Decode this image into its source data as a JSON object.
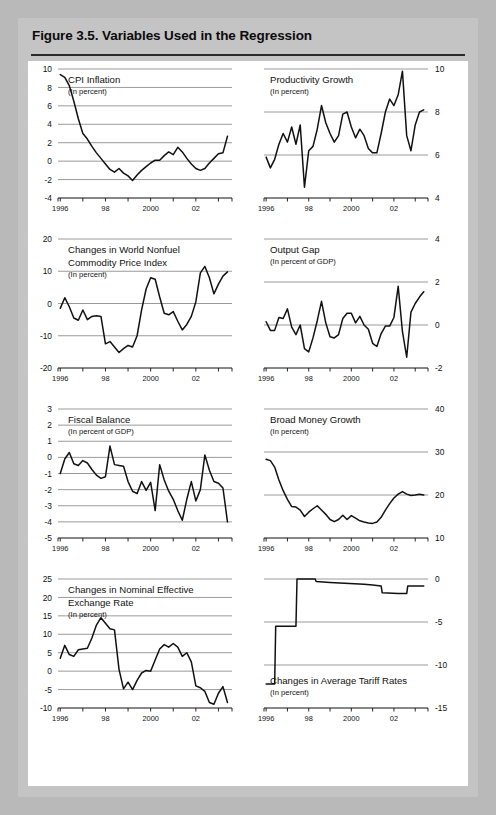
{
  "figure": {
    "title": "Figure 3.5. Variables Used in the Regression",
    "sources": "Sources:  CEIC database; and IMF staff calculations."
  },
  "chart_data": [
    {
      "id": "cpi-inflation",
      "type": "line",
      "title": "CPI Inflation",
      "subtitle": "(In percent)",
      "xlabel": "",
      "ylabel": "",
      "ylim": [
        -4,
        10
      ],
      "yticks": [
        -4,
        -2,
        0,
        2,
        4,
        6,
        8,
        10
      ],
      "ytick_labels": [
        "-4",
        "-2",
        "0",
        "2",
        "4",
        "6",
        "8",
        "10"
      ],
      "axis_side": "left",
      "grid": true,
      "xlim": [
        1995.9,
        2003.6
      ],
      "xticks": [
        1996,
        1997,
        1998,
        1999,
        2000,
        2001,
        2002,
        2003
      ],
      "xtick_labels": [
        "1996",
        "",
        "98",
        "",
        "2000",
        "",
        "02",
        ""
      ],
      "x": [
        1996.0,
        1996.2,
        1996.4,
        1996.6,
        1996.8,
        1997.0,
        1997.2,
        1997.4,
        1997.6,
        1997.8,
        1998.0,
        1998.2,
        1998.4,
        1998.6,
        1998.8,
        1999.0,
        1999.2,
        1999.4,
        1999.6,
        1999.8,
        2000.0,
        2000.2,
        2000.4,
        2000.6,
        2000.8,
        2001.0,
        2001.2,
        2001.4,
        2001.6,
        2001.8,
        2002.0,
        2002.2,
        2002.4,
        2002.6,
        2002.8,
        2003.0,
        2003.2,
        2003.4
      ],
      "values": [
        9.4,
        9.1,
        8.2,
        6.5,
        4.6,
        3.0,
        2.4,
        1.6,
        0.9,
        0.3,
        -0.3,
        -0.9,
        -1.2,
        -0.8,
        -1.3,
        -1.6,
        -2.1,
        -1.5,
        -1.0,
        -0.6,
        -0.2,
        0.1,
        0.1,
        0.6,
        1.0,
        0.7,
        1.5,
        1.0,
        0.3,
        -0.3,
        -0.8,
        -1.0,
        -0.8,
        -0.2,
        0.3,
        0.8,
        0.9,
        2.7
      ]
    },
    {
      "id": "productivity-growth",
      "type": "line",
      "title": "Productivity Growth",
      "subtitle": "(In percent)",
      "xlabel": "",
      "ylabel": "",
      "ylim": [
        4,
        10
      ],
      "yticks": [
        4,
        6,
        8,
        10
      ],
      "ytick_labels": [
        "4",
        "6",
        "8",
        "10"
      ],
      "axis_side": "right",
      "grid": true,
      "xlim": [
        1995.9,
        2003.6
      ],
      "xticks": [
        1996,
        1997,
        1998,
        1999,
        2000,
        2001,
        2002,
        2003
      ],
      "xtick_labels": [
        "1996",
        "",
        "98",
        "",
        "2000",
        "",
        "02",
        ""
      ],
      "x": [
        1996.0,
        1996.2,
        1996.4,
        1996.6,
        1996.8,
        1997.0,
        1997.2,
        1997.4,
        1997.6,
        1997.8,
        1998.0,
        1998.2,
        1998.4,
        1998.6,
        1998.8,
        1999.0,
        1999.2,
        1999.4,
        1999.6,
        1999.8,
        2000.0,
        2000.2,
        2000.4,
        2000.6,
        2000.8,
        2001.0,
        2001.2,
        2001.4,
        2001.6,
        2001.8,
        2002.0,
        2002.2,
        2002.4,
        2002.6,
        2002.8,
        2003.0,
        2003.2,
        2003.4
      ],
      "values": [
        5.9,
        5.4,
        5.8,
        6.5,
        7.0,
        6.6,
        7.3,
        6.5,
        7.4,
        4.5,
        6.2,
        6.4,
        7.2,
        8.3,
        7.5,
        7.0,
        6.6,
        6.9,
        7.9,
        8.0,
        7.3,
        6.8,
        7.2,
        6.9,
        6.3,
        6.1,
        6.1,
        7.0,
        8.0,
        8.6,
        8.3,
        8.8,
        9.9,
        6.9,
        6.2,
        7.4,
        8.0,
        8.1
      ]
    },
    {
      "id": "commodity-price-index",
      "type": "line",
      "title": "Changes in World Nonfuel Commodity Price Index",
      "subtitle": "(In percent)",
      "xlabel": "",
      "ylabel": "",
      "ylim": [
        -20,
        20
      ],
      "yticks": [
        -20,
        -10,
        0,
        10,
        20
      ],
      "ytick_labels": [
        "-20",
        "-10",
        "0",
        "10",
        "20"
      ],
      "axis_side": "left",
      "grid": true,
      "xlim": [
        1995.9,
        2003.6
      ],
      "xticks": [
        1996,
        1997,
        1998,
        1999,
        2000,
        2001,
        2002,
        2003
      ],
      "xtick_labels": [
        "1996",
        "",
        "98",
        "",
        "2000",
        "",
        "02",
        ""
      ],
      "x": [
        1996.0,
        1996.2,
        1996.4,
        1996.6,
        1996.8,
        1997.0,
        1997.2,
        1997.4,
        1997.6,
        1997.8,
        1998.0,
        1998.2,
        1998.4,
        1998.6,
        1998.8,
        1999.0,
        1999.2,
        1999.4,
        1999.6,
        1999.8,
        2000.0,
        2000.2,
        2000.4,
        2000.6,
        2000.8,
        2001.0,
        2001.2,
        2001.4,
        2001.6,
        2001.8,
        2002.0,
        2002.2,
        2002.4,
        2002.6,
        2002.8,
        2003.0,
        2003.2,
        2003.4
      ],
      "values": [
        -1.5,
        1.8,
        -1.0,
        -4.5,
        -5.2,
        -2.0,
        -5.0,
        -4.0,
        -3.8,
        -4.0,
        -12.5,
        -11.8,
        -13.5,
        -15.2,
        -14.0,
        -13.0,
        -13.5,
        -10.0,
        -2.0,
        4.5,
        8.0,
        7.5,
        2.0,
        -3.0,
        -3.5,
        -2.5,
        -5.5,
        -8.2,
        -6.5,
        -4.0,
        0.5,
        9.5,
        11.5,
        8.0,
        3.0,
        6.0,
        8.5,
        9.8
      ]
    },
    {
      "id": "output-gap",
      "type": "line",
      "title": "Output Gap",
      "subtitle": "(In percent of GDP)",
      "xlabel": "",
      "ylabel": "",
      "ylim": [
        -2,
        4
      ],
      "yticks": [
        -2,
        0,
        2,
        4
      ],
      "ytick_labels": [
        "-2",
        "0",
        "2",
        "4"
      ],
      "axis_side": "right",
      "grid": true,
      "xlim": [
        1995.9,
        2003.6
      ],
      "xticks": [
        1996,
        1997,
        1998,
        1999,
        2000,
        2001,
        2002,
        2003
      ],
      "xtick_labels": [
        "1996",
        "",
        "98",
        "",
        "2000",
        "",
        "02",
        ""
      ],
      "x": [
        1996.0,
        1996.2,
        1996.4,
        1996.6,
        1996.8,
        1997.0,
        1997.2,
        1997.4,
        1997.6,
        1997.8,
        1998.0,
        1998.2,
        1998.4,
        1998.6,
        1998.8,
        1999.0,
        1999.2,
        1999.4,
        1999.6,
        1999.8,
        2000.0,
        2000.2,
        2000.4,
        2000.6,
        2000.8,
        2001.0,
        2001.2,
        2001.4,
        2001.6,
        2001.8,
        2002.0,
        2002.2,
        2002.4,
        2002.6,
        2002.8,
        2003.0,
        2003.2,
        2003.4
      ],
      "values": [
        0.15,
        -0.25,
        -0.25,
        0.35,
        0.3,
        0.75,
        -0.1,
        -0.45,
        0.0,
        -1.1,
        -1.25,
        -0.6,
        0.2,
        1.1,
        0.1,
        -0.55,
        -0.6,
        -0.45,
        0.3,
        0.55,
        0.55,
        0.1,
        0.4,
        0.0,
        -0.2,
        -0.85,
        -1.0,
        -0.4,
        -0.05,
        -0.05,
        0.35,
        1.8,
        -0.3,
        -1.5,
        0.6,
        1.0,
        1.3,
        1.55
      ]
    },
    {
      "id": "fiscal-balance",
      "type": "line",
      "title": "Fiscal Balance",
      "subtitle": "(In percent of GDP)",
      "xlabel": "",
      "ylabel": "",
      "ylim": [
        -5,
        3
      ],
      "yticks": [
        -5,
        -4,
        -3,
        -2,
        -1,
        0,
        1,
        2,
        3
      ],
      "ytick_labels": [
        "-5",
        "-4",
        "-3",
        "-2",
        "-1",
        "0",
        "1",
        "2",
        "3"
      ],
      "axis_side": "left",
      "grid": true,
      "xlim": [
        1995.9,
        2003.6
      ],
      "xticks": [
        1996,
        1997,
        1998,
        1999,
        2000,
        2001,
        2002,
        2003
      ],
      "xtick_labels": [
        "1996",
        "",
        "98",
        "",
        "2000",
        "",
        "02",
        ""
      ],
      "x": [
        1996.0,
        1996.2,
        1996.4,
        1996.6,
        1996.8,
        1997.0,
        1997.2,
        1997.4,
        1997.6,
        1997.8,
        1998.0,
        1998.2,
        1998.4,
        1998.6,
        1998.8,
        1999.0,
        1999.2,
        1999.4,
        1999.6,
        1999.8,
        2000.0,
        2000.2,
        2000.4,
        2000.6,
        2000.8,
        2001.0,
        2001.2,
        2001.4,
        2001.6,
        2001.8,
        2002.0,
        2002.2,
        2002.4,
        2002.6,
        2002.8,
        2003.0,
        2003.2,
        2003.4
      ],
      "values": [
        -1.0,
        -0.1,
        0.3,
        -0.4,
        -0.5,
        -0.2,
        -0.35,
        -0.75,
        -1.1,
        -1.3,
        -1.2,
        0.7,
        -0.45,
        -0.5,
        -0.55,
        -1.5,
        -2.1,
        -2.25,
        -1.5,
        -2.05,
        -1.55,
        -3.3,
        -0.45,
        -1.4,
        -2.1,
        -2.6,
        -3.3,
        -3.9,
        -2.6,
        -1.5,
        -2.7,
        -2.0,
        0.15,
        -0.8,
        -1.5,
        -1.6,
        -1.9,
        -4.0
      ]
    },
    {
      "id": "broad-money-growth",
      "type": "line",
      "title": "Broad Money Growth",
      "subtitle": "(In percent)",
      "xlabel": "",
      "ylabel": "",
      "ylim": [
        10,
        40
      ],
      "yticks": [
        10,
        20,
        30,
        40
      ],
      "ytick_labels": [
        "10",
        "20",
        "30",
        "40"
      ],
      "axis_side": "right",
      "grid": true,
      "xlim": [
        1995.9,
        2003.6
      ],
      "xticks": [
        1996,
        1997,
        1998,
        1999,
        2000,
        2001,
        2002,
        2003
      ],
      "xtick_labels": [
        "1996",
        "",
        "98",
        "",
        "2000",
        "",
        "02",
        ""
      ],
      "x": [
        1996.0,
        1996.2,
        1996.4,
        1996.6,
        1996.8,
        1997.0,
        1997.2,
        1997.4,
        1997.6,
        1997.8,
        1998.0,
        1998.2,
        1998.4,
        1998.6,
        1998.8,
        1999.0,
        1999.2,
        1999.4,
        1999.6,
        1999.8,
        2000.0,
        2000.2,
        2000.4,
        2000.6,
        2000.8,
        2001.0,
        2001.2,
        2001.4,
        2001.6,
        2001.8,
        2002.0,
        2002.2,
        2002.4,
        2002.6,
        2002.8,
        2003.0,
        2003.2,
        2003.4
      ],
      "values": [
        28.3,
        28.0,
        26.5,
        23.5,
        21.0,
        19.0,
        17.3,
        17.2,
        16.5,
        15.0,
        16.0,
        16.8,
        17.5,
        16.5,
        15.5,
        14.3,
        13.8,
        14.3,
        15.3,
        14.3,
        15.2,
        14.6,
        14.0,
        13.7,
        13.5,
        13.4,
        13.7,
        14.8,
        16.5,
        18.0,
        19.3,
        20.2,
        20.8,
        20.2,
        19.9,
        20.0,
        20.2,
        20.0
      ]
    },
    {
      "id": "nominal-effective-exchange-rate",
      "type": "line",
      "title": "Changes in Nominal Effective Exchange Rate",
      "subtitle": "(In percent)",
      "xlabel": "",
      "ylabel": "",
      "ylim": [
        -10,
        25
      ],
      "yticks": [
        -10,
        -5,
        0,
        5,
        10,
        15,
        20,
        25
      ],
      "ytick_labels": [
        "-10",
        "-5",
        "0",
        "5",
        "10",
        "15",
        "20",
        "25"
      ],
      "axis_side": "left",
      "grid": true,
      "xlim": [
        1995.9,
        2003.6
      ],
      "xticks": [
        1996,
        1997,
        1998,
        1999,
        2000,
        2001,
        2002,
        2003
      ],
      "xtick_labels": [
        "1996",
        "",
        "98",
        "",
        "2000",
        "",
        "02",
        ""
      ],
      "x": [
        1996.0,
        1996.2,
        1996.4,
        1996.6,
        1996.8,
        1997.0,
        1997.2,
        1997.4,
        1997.6,
        1997.8,
        1998.0,
        1998.2,
        1998.4,
        1998.6,
        1998.8,
        1999.0,
        1999.2,
        1999.4,
        1999.6,
        1999.8,
        2000.0,
        2000.2,
        2000.4,
        2000.6,
        2000.8,
        2001.0,
        2001.2,
        2001.4,
        2001.6,
        2001.8,
        2002.0,
        2002.2,
        2002.4,
        2002.6,
        2002.8,
        2003.0,
        2003.2,
        2003.4
      ],
      "values": [
        3.5,
        7.0,
        4.5,
        4.0,
        5.8,
        6.0,
        6.2,
        9.0,
        12.5,
        14.5,
        13.0,
        11.5,
        11.2,
        0.5,
        -4.8,
        -3.0,
        -5.0,
        -2.5,
        -0.5,
        0.2,
        0.0,
        3.0,
        6.0,
        7.2,
        6.5,
        7.5,
        6.5,
        4.0,
        5.0,
        2.5,
        -4.0,
        -4.5,
        -5.5,
        -8.5,
        -9.0,
        -6.0,
        -4.2,
        -8.5
      ]
    },
    {
      "id": "average-tariff-rates",
      "type": "line",
      "title": "Changes in Average Tariff Rates",
      "subtitle": "(In percent)",
      "xlabel": "",
      "ylabel": "",
      "ylim": [
        -15,
        0
      ],
      "yticks": [
        -15,
        -10,
        -5,
        0
      ],
      "ytick_labels": [
        "-15",
        "-10",
        "-5",
        "0"
      ],
      "axis_side": "right",
      "grid": true,
      "xlim": [
        1995.9,
        2003.6
      ],
      "xticks": [
        1996,
        1997,
        1998,
        1999,
        2000,
        2001,
        2002,
        2003
      ],
      "xtick_labels": [
        "1996",
        "",
        "98",
        "",
        "2000",
        "",
        "02",
        ""
      ],
      "x": [
        1996.0,
        1996.2,
        1996.4,
        1996.45,
        1996.6,
        1997.4,
        1997.45,
        1997.7,
        1998.3,
        1998.35,
        1999.0,
        2000.6,
        2001.0,
        2001.4,
        2001.45,
        2002.2,
        2002.6,
        2002.65,
        2003.0,
        2003.4
      ],
      "values": [
        -12.2,
        -12.2,
        -12.2,
        -5.5,
        -5.5,
        -5.5,
        0.0,
        0.0,
        0.0,
        -0.3,
        -0.4,
        -0.6,
        -0.7,
        -0.8,
        -1.6,
        -1.7,
        -1.7,
        -0.8,
        -0.8,
        -0.8
      ]
    }
  ]
}
